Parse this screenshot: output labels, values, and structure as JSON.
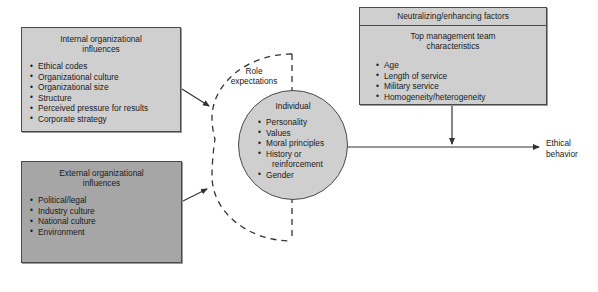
{
  "diagram": {
    "colors": {
      "box_light": "#cfcfcf",
      "box_dark": "#a6a6a6",
      "line": "#333333",
      "border": "#4a4a4a",
      "background": "#ffffff"
    }
  },
  "internal_box": {
    "title_line1": "Internal organizational",
    "title_line2": "influences",
    "items": [
      "Ethical codes",
      "Organizational culture",
      "Organizational size",
      "Structure",
      "Perceived pressure for results",
      "Corporate strategy"
    ]
  },
  "external_box": {
    "title_line1": "External organizational",
    "title_line2": "influences",
    "items": [
      "Political/legal",
      "Industry culture",
      "National culture",
      "Environment"
    ]
  },
  "factors_box": {
    "header": "Neutralizing/enhancing factors",
    "title_line1": "Top management team",
    "title_line2": "characteristics",
    "items": [
      "Age",
      "Length of service",
      "Military service",
      "Homogeneity/heterogeneity"
    ]
  },
  "circle": {
    "title": "Individual",
    "items": [
      "Personality",
      "Values",
      "Moral principles",
      "History or",
      "reinforcement",
      "Gender"
    ]
  },
  "role_label": {
    "line1": "Role",
    "line2": "expectations"
  },
  "outcome_label": {
    "line1": "Ethical",
    "line2": "behavior"
  }
}
